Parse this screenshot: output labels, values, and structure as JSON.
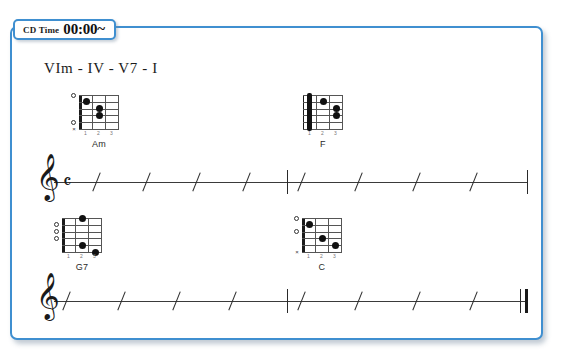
{
  "cd_time": {
    "label": "CD Time",
    "value": "00:00~"
  },
  "title": "VIm - IV - V7 - I",
  "colors": {
    "frame_border": "#3f8fd0",
    "background": "#ffffff",
    "ink": "#1a1a1a"
  },
  "systems": [
    {
      "name": "system-1",
      "chords": [
        {
          "name": "Am",
          "fret_numbers": [
            "1",
            "2",
            "3"
          ],
          "open_strings": [
            5,
            1
          ],
          "muted_strings": [
            6
          ],
          "dots": [
            {
              "string": 4,
              "fret": 2
            },
            {
              "string": 3,
              "fret": 2
            },
            {
              "string": 2,
              "fret": 1
            }
          ],
          "barre": null
        },
        {
          "name": "F",
          "fret_numbers": [
            "1",
            "2",
            "3"
          ],
          "open_strings": [],
          "muted_strings": [],
          "dots": [
            {
              "string": 4,
              "fret": 3
            },
            {
              "string": 3,
              "fret": 2
            },
            {
              "string": 2,
              "fret": 2
            }
          ],
          "barre": {
            "fret": 1,
            "from_string": 6,
            "to_string": 1
          }
        }
      ],
      "staff": {
        "clef": "treble-clef",
        "time_signature": "common-time",
        "beats": 8,
        "barline_after_beat": 4,
        "ending": "single"
      }
    },
    {
      "name": "system-2",
      "chords": [
        {
          "name": "G7",
          "fret_numbers": [
            "1",
            "2",
            "3"
          ],
          "open_strings": [
            4,
            3,
            2
          ],
          "muted_strings": [],
          "dots": [
            {
              "string": 6,
              "fret": 3
            },
            {
              "string": 5,
              "fret": 2
            },
            {
              "string": 1,
              "fret": 1
            }
          ],
          "barre": null
        },
        {
          "name": "C",
          "fret_numbers": [
            "1",
            "2",
            "3"
          ],
          "open_strings": [
            3,
            1
          ],
          "muted_strings": [
            6
          ],
          "dots": [
            {
              "string": 5,
              "fret": 3
            },
            {
              "string": 4,
              "fret": 2
            },
            {
              "string": 2,
              "fret": 1
            }
          ],
          "barre": null
        }
      ],
      "staff": {
        "clef": "treble-clef",
        "time_signature": "",
        "beats": 8,
        "barline_after_beat": 4,
        "ending": "final-double"
      }
    }
  ]
}
